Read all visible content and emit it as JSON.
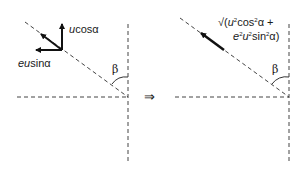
{
  "left_panel": {
    "label_ucos": {
      "var": "u",
      "rest": "cosα"
    },
    "label_eusin": {
      "var": "eu",
      "rest": "sinα"
    },
    "angle": "β"
  },
  "implies_symbol": "⇒",
  "right_panel": {
    "label_line1": {
      "root": "√(",
      "u": "u",
      "sq1": "2",
      "cos": "cos",
      "sq2": "2",
      "tail": "α +"
    },
    "label_line2": {
      "e": "e",
      "sq1": "2",
      "u": "u",
      "sq2": "2",
      "sin": "sin",
      "sq3": "2",
      "tail": "α)"
    },
    "angle": "β"
  },
  "colors": {
    "line": "#333333",
    "arrow": "#111111"
  }
}
